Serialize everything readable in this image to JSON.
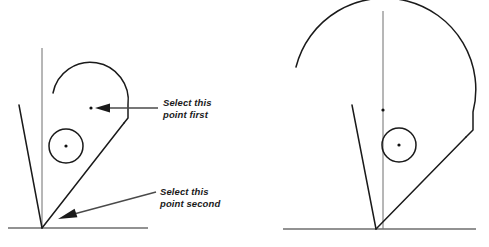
{
  "figure": {
    "background_color": "#ffffff",
    "line_color": "#1a1a1a",
    "centerline_color": "#6e6e6e",
    "width": 489,
    "height": 247
  },
  "callouts": [
    {
      "id": "first",
      "line1": "Select this",
      "line2": "point first",
      "text_x": 163,
      "text_y": 106,
      "line2_x": 163,
      "line2_y": 118,
      "leader_from_x": 158,
      "leader_from_y": 108,
      "leader_to_x": 104,
      "leader_to_y": 108,
      "arrow_tip_x": 95,
      "arrow_tip_y": 108,
      "arrow_back_x": 110,
      "arrow_back_y": 108,
      "arrow_half_height": 4.5
    },
    {
      "id": "second",
      "line1": "Select this",
      "line2": "point second",
      "text_x": 160,
      "text_y": 195,
      "line2_x": 160,
      "line2_y": 207,
      "leader_from_x": 156,
      "leader_from_y": 192,
      "leader_to_x": 74,
      "leader_to_y": 214,
      "arrow_tip_x": 58,
      "arrow_tip_y": 219,
      "arrow_back_x": 76,
      "arrow_back_y": 213,
      "arrow_half_height": 4.5
    }
  ],
  "left_view": {
    "name": "left-view",
    "apex_x": 42,
    "apex_y": 228,
    "baseline_x1": 8,
    "baseline_x2": 148,
    "baseline_y": 228,
    "centerline_x": 42,
    "centerline_y1": 48,
    "centerline_y2": 228,
    "construction_x1": 19,
    "construction_y1": 105,
    "construction_x2": 42,
    "construction_y2": 228,
    "arc_path": "M 53 93 A 38 38 0 0 1 128 105 L 128 118 L 124 123",
    "teardrop_path": "M 124 123 L 42 228",
    "circle_cx": 66,
    "circle_cy": 146,
    "circle_r": 17,
    "circle_dot_x": 66,
    "circle_dot_y": 146,
    "center_dot_x": 91,
    "center_dot_y": 108,
    "dot_r": 1.6
  },
  "right_view": {
    "name": "right-view",
    "apex_x": 376,
    "apex_y": 229,
    "baseline_x1": 283,
    "baseline_x2": 476,
    "baseline_y": 229,
    "centerline_x": 383,
    "centerline_y1": 11,
    "centerline_y2": 229,
    "construction_x1": 352,
    "construction_y1": 105,
    "construction_x2": 376,
    "construction_y2": 229,
    "arc_path": "M 296 67 A 88 88 0 0 1 473 112 L 473 130 L 466 137",
    "teardrop_path": "M 466 137 L 376 229",
    "circle_cx": 399,
    "circle_cy": 145,
    "circle_r": 17,
    "circle_dot_x": 399,
    "circle_dot_y": 145,
    "center_dot_x": 383,
    "center_dot_y": 110,
    "dot_r": 1.6
  }
}
